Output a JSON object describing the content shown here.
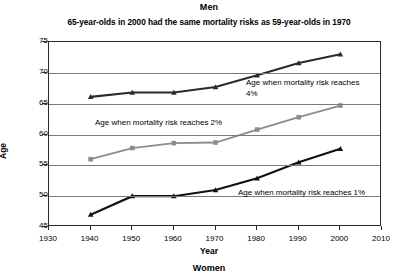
{
  "chart_data": {
    "type": "line",
    "title": "Men",
    "subtitle": "65-year-olds in 2000 had the same mortality risks as 59-year-olds in 1970",
    "xlabel": "Year",
    "ylabel": "Age",
    "xlim": [
      1930,
      2010
    ],
    "ylim": [
      45,
      75
    ],
    "xticks": [
      1930,
      1940,
      1950,
      1960,
      1970,
      1980,
      1990,
      2000,
      2010
    ],
    "yticks": [
      45,
      50,
      55,
      60,
      65,
      70,
      75
    ],
    "grid": true,
    "legend_position": "inline-annotations",
    "x": [
      1940,
      1950,
      1960,
      1970,
      1980,
      1990,
      2000
    ],
    "series": [
      {
        "name": "Age when mortality risk reaches 4%",
        "color": "#2b2b2b",
        "marker": "triangle",
        "values": [
          66.1,
          66.8,
          66.8,
          67.7,
          69.6,
          71.6,
          73.0
        ]
      },
      {
        "name": "Age when mortality risk reaches 2%",
        "color": "#8c8c8c",
        "marker": "square",
        "values": [
          56.0,
          57.8,
          58.6,
          58.7,
          60.8,
          62.8,
          64.7
        ]
      },
      {
        "name": "Age when mortality risk reaches 1%",
        "color": "#111111",
        "marker": "triangle",
        "values": [
          47.0,
          50.0,
          50.0,
          51.0,
          52.9,
          55.5,
          57.7
        ]
      }
    ],
    "annotations": [
      {
        "id": "annot-4",
        "text": "Age when mortality risk reaches\n4%"
      },
      {
        "id": "annot-2",
        "text": "Age when mortality risk reaches 2%"
      },
      {
        "id": "annot-1",
        "text": "Age when mortality risk reaches 1%"
      }
    ]
  },
  "footer": {
    "next_panel_title": "Women"
  }
}
